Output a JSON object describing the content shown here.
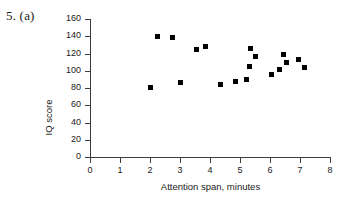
{
  "question_label": "5. (a)",
  "chart_data": {
    "type": "scatter",
    "title": "",
    "xlabel": "Attention span, minutes",
    "ylabel": "IQ score",
    "xlim": [
      0,
      8
    ],
    "ylim": [
      0,
      160
    ],
    "xticks": [
      0,
      1,
      2,
      3,
      4,
      5,
      6,
      7,
      8
    ],
    "yticks": [
      0,
      20,
      40,
      60,
      80,
      100,
      120,
      140,
      160
    ],
    "grid": false,
    "legend": null,
    "marker": "filled-square",
    "marker_color": "#000000",
    "points": [
      {
        "x": 2.0,
        "y": 81
      },
      {
        "x": 2.25,
        "y": 140
      },
      {
        "x": 2.75,
        "y": 138
      },
      {
        "x": 3.0,
        "y": 86
      },
      {
        "x": 3.55,
        "y": 125
      },
      {
        "x": 3.85,
        "y": 128
      },
      {
        "x": 4.35,
        "y": 84
      },
      {
        "x": 4.85,
        "y": 87
      },
      {
        "x": 5.2,
        "y": 90
      },
      {
        "x": 5.3,
        "y": 105
      },
      {
        "x": 5.35,
        "y": 126
      },
      {
        "x": 5.5,
        "y": 116
      },
      {
        "x": 6.05,
        "y": 96
      },
      {
        "x": 6.3,
        "y": 101
      },
      {
        "x": 6.45,
        "y": 119
      },
      {
        "x": 6.55,
        "y": 110
      },
      {
        "x": 6.95,
        "y": 113
      },
      {
        "x": 7.15,
        "y": 104
      }
    ]
  }
}
